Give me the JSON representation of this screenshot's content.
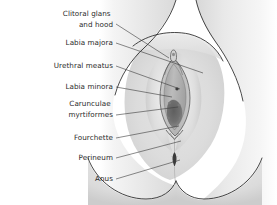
{
  "figure": {
    "view": "lithotomy position, anterior-inferior view",
    "background_color": "#ffffff",
    "line_color": "#262626",
    "leader_color": "#3a3a3a",
    "text_color": "#2b2b2b",
    "skin_light": "#f2f2f2",
    "skin_mid": "#dcdcdc",
    "skin_shadow": "#c4c4c4",
    "mucosa_mid": "#b9b9b9",
    "mucosa_dark": "#8a8a8a",
    "vagina_dark": "#6e6e6e"
  },
  "labels": [
    {
      "id": "clitoral-glans-and-hood",
      "lines": [
        "Clitoral glans",
        "and hood"
      ],
      "text_x": 113,
      "text_y": 16,
      "line_height": 10.5,
      "leader": "M116,24 L169,58"
    },
    {
      "id": "labia-majora",
      "lines": [
        "Labia majora"
      ],
      "text_x": 113,
      "text_y": 45,
      "line_height": 10.5,
      "leader": "M116,43 L203,73"
    },
    {
      "id": "urethral-meatus",
      "lines": [
        "Urethral meatus"
      ],
      "text_x": 113,
      "text_y": 68,
      "line_height": 10.5,
      "leader": "M116,66 L180,89"
    },
    {
      "id": "labia-minora",
      "lines": [
        "Labia minora"
      ],
      "text_x": 113,
      "text_y": 89,
      "line_height": 10.5,
      "leader": "M116,87 L172,97"
    },
    {
      "id": "carunculae-myrtiformes",
      "lines": [
        "Carunculae",
        "myrtiformes"
      ],
      "text_x": 113,
      "text_y": 106,
      "line_height": 10.5,
      "leader": "M116,115 L178,107"
    },
    {
      "id": "fourchette",
      "lines": [
        "Fourchette"
      ],
      "text_x": 113,
      "text_y": 140,
      "line_height": 10.5,
      "leader": "M116,138 L179,126"
    },
    {
      "id": "perineum",
      "lines": [
        "Perineum"
      ],
      "text_x": 113,
      "text_y": 160,
      "line_height": 10.5,
      "leader": "M116,158 L181,141"
    },
    {
      "id": "anus",
      "lines": [
        "Anus"
      ],
      "text_x": 113,
      "text_y": 181,
      "line_height": 10.5,
      "leader": "M116,179 L180,160"
    }
  ]
}
